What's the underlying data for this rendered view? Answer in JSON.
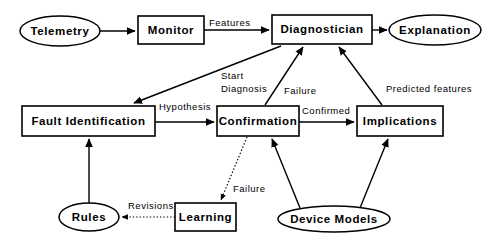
{
  "diagram": {
    "background_color": "#ffffff",
    "stroke_color": "#000000",
    "nodes": [
      {
        "id": "telemetry",
        "label": "Telemetry",
        "shape": "ellipse",
        "cx": 60,
        "cy": 31,
        "rx": 40,
        "ry": 15
      },
      {
        "id": "monitor",
        "label": "Monitor",
        "shape": "box",
        "x": 138,
        "y": 16,
        "w": 66,
        "h": 28
      },
      {
        "id": "diagnostician",
        "label": "Diagnostician",
        "shape": "box",
        "x": 272,
        "y": 15,
        "w": 100,
        "h": 29
      },
      {
        "id": "explanation",
        "label": "Explanation",
        "shape": "ellipse",
        "cx": 435,
        "cy": 30,
        "rx": 46,
        "ry": 15
      },
      {
        "id": "fault_id",
        "label": "Fault Identification",
        "shape": "box",
        "x": 22,
        "y": 106,
        "w": 133,
        "h": 30
      },
      {
        "id": "confirmation",
        "label": "Confirmation",
        "shape": "box",
        "x": 217,
        "y": 106,
        "w": 82,
        "h": 30
      },
      {
        "id": "implications",
        "label": "Implications",
        "shape": "box",
        "x": 357,
        "y": 106,
        "w": 86,
        "h": 30
      },
      {
        "id": "rules",
        "label": "Rules",
        "shape": "ellipse",
        "cx": 89,
        "cy": 217,
        "rx": 30,
        "ry": 14
      },
      {
        "id": "learning",
        "label": "Learning",
        "shape": "box",
        "x": 175,
        "y": 203,
        "w": 61,
        "h": 28
      },
      {
        "id": "device_models",
        "label": "Device Models",
        "shape": "ellipse",
        "cx": 334,
        "cy": 219,
        "rx": 56,
        "ry": 13
      }
    ],
    "edges": [
      {
        "id": "telemetry-monitor",
        "from": "telemetry",
        "to": "monitor",
        "label": "",
        "style": "solid"
      },
      {
        "id": "monitor-diagnostician",
        "from": "monitor",
        "to": "diagnostician",
        "label": "Features",
        "style": "solid"
      },
      {
        "id": "diagnostician-explanation",
        "from": "diagnostician",
        "to": "explanation",
        "label": "",
        "style": "solid"
      },
      {
        "id": "diagnostician-fault-id",
        "from": "diagnostician",
        "to": "fault_id",
        "label": "Start Diagnosis",
        "style": "solid"
      },
      {
        "id": "fault-id-confirmation",
        "from": "fault_id",
        "to": "confirmation",
        "label": "Hypothesis",
        "style": "solid"
      },
      {
        "id": "confirmation-implications",
        "from": "confirmation",
        "to": "implications",
        "label": "Confirmed",
        "style": "solid"
      },
      {
        "id": "confirmation-diagnostician",
        "from": "confirmation",
        "to": "diagnostician",
        "label": "Failure",
        "style": "solid"
      },
      {
        "id": "implications-diagnostician",
        "from": "implications",
        "to": "diagnostician",
        "label": "Predicted features",
        "style": "solid"
      },
      {
        "id": "confirmation-learning",
        "from": "confirmation",
        "to": "learning",
        "label": "Failure",
        "style": "dotted"
      },
      {
        "id": "learning-rules",
        "from": "learning",
        "to": "rules",
        "label": "Revisions",
        "style": "dotted"
      },
      {
        "id": "rules-fault-id",
        "from": "rules",
        "to": "fault_id",
        "label": "",
        "style": "solid"
      },
      {
        "id": "device-models-confirmation",
        "from": "device_models",
        "to": "confirmation",
        "label": "",
        "style": "solid"
      },
      {
        "id": "device-models-implications",
        "from": "device_models",
        "to": "implications",
        "label": "",
        "style": "solid"
      }
    ],
    "edge_labels": {
      "features": "Features",
      "start_diagnosis_line1": "Start",
      "start_diagnosis_line2": "Diagnosis",
      "hypothesis": "Hypothesis",
      "confirmed": "Confirmed",
      "failure_up": "Failure",
      "predicted_features": "Predicted features",
      "failure_down": "Failure",
      "revisions": "Revisions"
    },
    "node_labels": {
      "telemetry": "Telemetry",
      "monitor": "Monitor",
      "diagnostician": "Diagnostician",
      "explanation": "Explanation",
      "fault_identification": "Fault Identification",
      "confirmation": "Confirmation",
      "implications": "Implications",
      "rules": "Rules",
      "learning": "Learning",
      "device_models": "Device Models"
    }
  }
}
